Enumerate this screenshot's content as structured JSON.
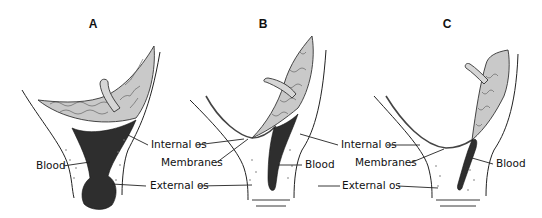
{
  "figure": {
    "panels": [
      {
        "id": "A",
        "letter": "A",
        "labels": {
          "blood": "Blood"
        }
      },
      {
        "id": "B",
        "letter": "B",
        "labels": {
          "internal_os": "Internal os",
          "membranes": "Membranes",
          "external_os": "External os",
          "blood": "Blood"
        }
      },
      {
        "id": "C",
        "letter": "C",
        "labels": {
          "internal_os": "Internal os",
          "membranes": "Membranes",
          "external_os": "External os",
          "blood": "Blood"
        }
      }
    ]
  }
}
